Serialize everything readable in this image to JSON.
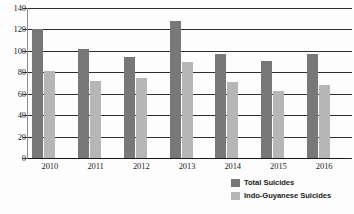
{
  "chart_data": {
    "type": "bar",
    "title": "",
    "subtitle": "",
    "xlabel": "",
    "ylabel": "",
    "categories": [
      "2010",
      "2011",
      "2012",
      "2013",
      "2014",
      "2015",
      "2016"
    ],
    "series": [
      {
        "name": "Total Suicides",
        "color": "#787878",
        "values": [
          120,
          102,
          94,
          128,
          97,
          91,
          97
        ]
      },
      {
        "name": "Indo-Guyanese Suicides",
        "color": "#b6b6b6",
        "values": [
          81,
          72,
          75,
          90,
          71,
          63,
          68
        ]
      }
    ],
    "ylim": [
      0,
      140
    ],
    "y_ticks": [
      0,
      20,
      40,
      60,
      80,
      100,
      120,
      140
    ],
    "y_tick_labels": [
      "0",
      "20",
      "40",
      "60",
      "80",
      "100",
      "120",
      "140"
    ],
    "x_tick_labels": [
      "2010",
      "2011",
      "2012",
      "2013",
      "2014",
      "2015",
      "2016"
    ],
    "grid": true,
    "grid_axis": "y",
    "legend_position": "bottom-right",
    "legend_entries": [
      "Total Suicides",
      "Indo-Guyanese Suicides"
    ],
    "annotations": [],
    "background_color": "#fdfdfd",
    "gridline_color": "#2e2e2e",
    "axis_text_color": "#1d1d1d"
  },
  "legend": {
    "entries": [
      {
        "label": "Total Suicides",
        "swatch": "total"
      },
      {
        "label": "Indo-Guyanese Suicides",
        "swatch": "indo"
      }
    ]
  }
}
